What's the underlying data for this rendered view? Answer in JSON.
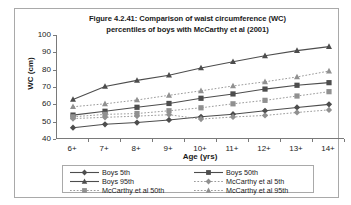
{
  "chart_data": {
    "type": "line",
    "title": "Figure 4.2.41: Comparison of waist circumference (WC) percentiles of boys with McCarthy et al (2001)",
    "title_line1": "Figure 4.2.41: Comparison of waist circumference (WC)",
    "title_line2": "percentiles of boys with McCarthy et al (2001)",
    "xlabel": "Age (yrs)",
    "ylabel": "WC (cm)",
    "categories": [
      "6+",
      "7+",
      "8+",
      "9+",
      "10+",
      "11+",
      "12+",
      "13+",
      "14+"
    ],
    "x": [
      "6+",
      "7+",
      "8+",
      "9+",
      "10+",
      "11+",
      "12+",
      "13+",
      "14+"
    ],
    "ylim": [
      40,
      100
    ],
    "yticks": [
      40,
      50,
      60,
      70,
      80,
      90,
      100
    ],
    "grid": false,
    "legend_position": "bottom",
    "series": [
      {
        "name": "Boys 5th",
        "values": [
          46.5,
          48.5,
          49.5,
          51.0,
          52.8,
          54.3,
          56.3,
          58.2,
          60.0
        ],
        "marker": "diamond",
        "linestyle": "solid",
        "color": "#4d4d4d"
      },
      {
        "name": "Boys 50th",
        "values": [
          53.8,
          56.0,
          58.3,
          60.5,
          63.5,
          66.0,
          68.8,
          71.0,
          72.5
        ],
        "marker": "square",
        "linestyle": "solid",
        "color": "#4d4d4d"
      },
      {
        "name": "Boys 95th",
        "values": [
          62.8,
          70.3,
          73.8,
          76.8,
          81.0,
          84.6,
          88.0,
          91.0,
          93.3
        ],
        "marker": "triangle",
        "linestyle": "solid",
        "color": "#4d4d4d"
      },
      {
        "name": "McCarthy et al 5th",
        "values": [
          51.8,
          52.5,
          53.2,
          54.0,
          51.5,
          52.7,
          53.6,
          55.3,
          56.8
        ],
        "marker": "diamond",
        "linestyle": "dotted",
        "color": "#909090"
      },
      {
        "name": "McCarthy et al 50th",
        "values": [
          52.8,
          54.2,
          54.7,
          56.3,
          58.0,
          60.3,
          62.3,
          64.8,
          67.3
        ],
        "marker": "square",
        "linestyle": "dotted",
        "color": "#909090"
      },
      {
        "name": "McCarthy et al 95th",
        "values": [
          58.6,
          60.3,
          62.5,
          65.2,
          67.8,
          70.6,
          73.0,
          75.8,
          79.2
        ],
        "marker": "triangle",
        "linestyle": "dotted",
        "color": "#909090"
      }
    ]
  }
}
